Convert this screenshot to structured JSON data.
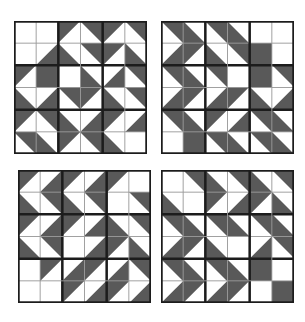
{
  "figure": {
    "width": 305,
    "height": 322,
    "background_color": "#ffffff",
    "dark_color": "#595959",
    "light_color": "#ffffff",
    "thin_line_color": "#9a9a9a",
    "thick_line_color": "#1c1c1c",
    "rows": 6,
    "cols": 6,
    "unit_legend": {
      "w": "white square",
      "d": "dark square",
      "tl": "dark triangle upper-left",
      "tr": "dark triangle upper-right",
      "bl": "dark triangle lower-left",
      "br": "dark triangle lower-right"
    }
  },
  "blocks": [
    {
      "id": "block-top-left",
      "position": "top-left",
      "x": 14,
      "y": 21,
      "size": 133,
      "cells": [
        [
          "w",
          "w",
          "tl",
          "tr",
          "tl",
          "tr"
        ],
        [
          "w",
          "br",
          "bl",
          "tr",
          "tl",
          "bl"
        ],
        [
          "tl",
          "d",
          "w",
          "bl",
          "br",
          "tr"
        ],
        [
          "bl",
          "br",
          "tr",
          "tl",
          "bl",
          "tr"
        ],
        [
          "tl",
          "tr",
          "bl",
          "br",
          "tl",
          "br"
        ],
        [
          "tr",
          "bl",
          "tl",
          "tr",
          "bl",
          "w"
        ]
      ]
    },
    {
      "id": "block-top-right",
      "position": "top-right",
      "x": 161,
      "y": 21,
      "size": 133,
      "cells": [
        [
          "tr",
          "bl",
          "tr",
          "bl",
          "w",
          "w"
        ],
        [
          "br",
          "tl",
          "bl",
          "tr",
          "d",
          "w"
        ],
        [
          "tr",
          "bl",
          "tr",
          "w",
          "d",
          "tr"
        ],
        [
          "br",
          "tl",
          "br",
          "tl",
          "bl",
          "br"
        ],
        [
          "tr",
          "bl",
          "tl",
          "br",
          "tr",
          "bl"
        ],
        [
          "w",
          "d",
          "tr",
          "bl",
          "tr",
          "bl"
        ]
      ]
    },
    {
      "id": "block-bottom-left",
      "position": "bottom-left",
      "x": 18,
      "y": 170,
      "size": 133,
      "cells": [
        [
          "tl",
          "br",
          "tl",
          "br",
          "tl",
          "w"
        ],
        [
          "bl",
          "tr",
          "bl",
          "tr",
          "w",
          "tr"
        ],
        [
          "tl",
          "br",
          "tl",
          "br",
          "bl",
          "tr"
        ],
        [
          "bl",
          "tr",
          "w",
          "br",
          "tl",
          "bl"
        ],
        [
          "w",
          "tl",
          "br",
          "tl",
          "br",
          "tr"
        ],
        [
          "w",
          "w",
          "tl",
          "br",
          "tl",
          "br"
        ]
      ]
    },
    {
      "id": "block-bottom-right",
      "position": "bottom-right",
      "x": 161,
      "y": 170,
      "size": 133,
      "cells": [
        [
          "w",
          "tr",
          "bl",
          "tr",
          "bl",
          "tr"
        ],
        [
          "bl",
          "w",
          "tl",
          "br",
          "tl",
          "bl"
        ],
        [
          "tr",
          "bl",
          "tr",
          "bl",
          "tr",
          "bl"
        ],
        [
          "br",
          "tl",
          "bl",
          "w",
          "br",
          "tr"
        ],
        [
          "tr",
          "bl",
          "tr",
          "bl",
          "d",
          "w"
        ],
        [
          "br",
          "tl",
          "br",
          "tl",
          "w",
          "d"
        ]
      ]
    }
  ]
}
